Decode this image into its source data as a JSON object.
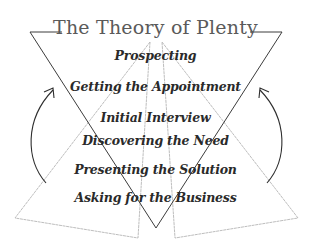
{
  "title": "The Theory of Plenty",
  "steps": [
    "Prospecting",
    "Getting the Appointment",
    "Initial Interview",
    "Discovering the Need",
    "Presenting the Solution",
    "Asking for the Business"
  ],
  "colors": {
    "dark_line": "#3a3a3a",
    "light_line": "#b8b8b8",
    "text": "#2a2a2a",
    "title": "#5a5a5a"
  }
}
